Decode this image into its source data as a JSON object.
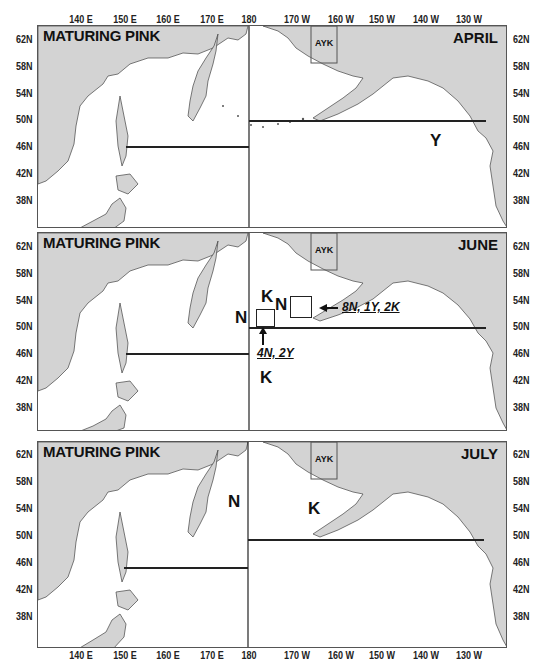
{
  "figure": {
    "x_ticks_top": [
      "140 E",
      "150 E",
      "160 E",
      "170 E",
      "180",
      "170 W",
      "160 W",
      "150 W",
      "140 W",
      "130 W"
    ],
    "x_ticks_bottom": [
      "140 E",
      "150 E",
      "160 E",
      "170 E",
      "180",
      "170 W",
      "160 W",
      "150 W",
      "140 W",
      "130 W"
    ],
    "y_ticks": [
      "62N",
      "58N",
      "54N",
      "50N",
      "46N",
      "42N",
      "38N"
    ],
    "colors": {
      "land": "#d3d3d3",
      "ocean": "#ffffff",
      "lines": "#222222"
    }
  },
  "panels": [
    {
      "title": "MATURING PINK",
      "month": "APRIL",
      "region_label": "AYK",
      "markers": [
        {
          "text": "Y"
        }
      ],
      "notes": []
    },
    {
      "title": "MATURING PINK",
      "month": "JUNE",
      "region_label": "AYK",
      "markers": [
        {
          "text": "N"
        },
        {
          "text": "K"
        },
        {
          "text": "N"
        },
        {
          "text": "K"
        }
      ],
      "notes": [
        {
          "text": "8N, 1Y, 2K"
        },
        {
          "text": "4N, 2Y"
        }
      ]
    },
    {
      "title": "MATURING PINK",
      "month": "JULY",
      "region_label": "AYK",
      "markers": [
        {
          "text": "N"
        },
        {
          "text": "K"
        }
      ],
      "notes": []
    }
  ]
}
